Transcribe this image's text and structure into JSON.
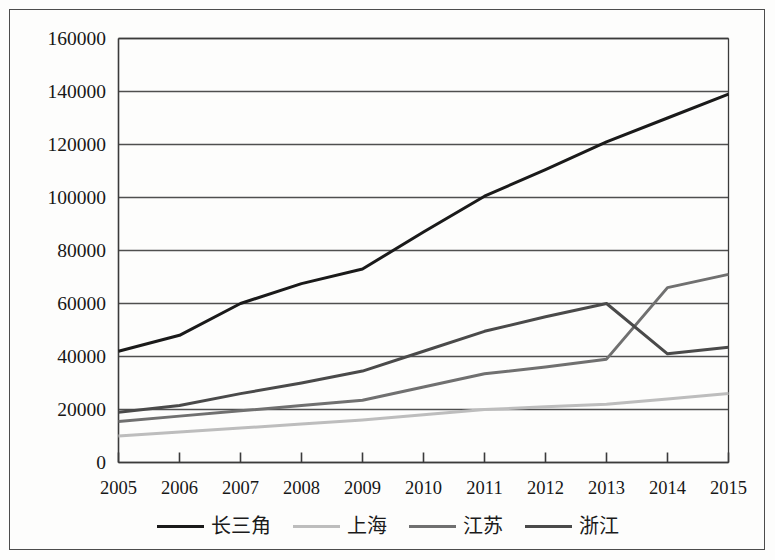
{
  "chart_data": {
    "type": "line",
    "title": "",
    "subtitle": "",
    "xlabel": "",
    "ylabel": "",
    "x": [
      2005,
      2006,
      2007,
      2008,
      2009,
      2010,
      2011,
      2012,
      2013,
      2014,
      2015
    ],
    "categories": [
      "2005",
      "2006",
      "2007",
      "2008",
      "2009",
      "2010",
      "2011",
      "2012",
      "2013",
      "2014",
      "2015"
    ],
    "xlim": [
      2005,
      2015
    ],
    "ylim": [
      0,
      160000
    ],
    "ytick_values": [
      0,
      20000,
      40000,
      60000,
      80000,
      100000,
      120000,
      140000,
      160000
    ],
    "ytick_labels": [
      "0",
      "20000",
      "40000",
      "60000",
      "80000",
      "100000",
      "120000",
      "140000",
      "160000"
    ],
    "grid": true,
    "grid_axis": "y",
    "legend_position": "bottom",
    "series": [
      {
        "name": "长三角",
        "color": "#1a1a1a",
        "width": 3.0,
        "values": [
          42000,
          48000,
          60000,
          67500,
          73000,
          87000,
          100500,
          110500,
          121000,
          130000,
          139000
        ]
      },
      {
        "name": "上海",
        "color": "#bdbdbd",
        "width": 3.0,
        "values": [
          10000,
          11500,
          13000,
          14500,
          16000,
          18000,
          20000,
          21000,
          22000,
          24000,
          26000
        ]
      },
      {
        "name": "江苏",
        "color": "#707070",
        "width": 3.0,
        "values": [
          15500,
          17500,
          19500,
          21500,
          23500,
          28500,
          33500,
          36000,
          39000,
          66000,
          71000
        ]
      },
      {
        "name": "浙江",
        "color": "#4a4a4a",
        "width": 3.0,
        "values": [
          19000,
          21500,
          26000,
          30000,
          34500,
          42000,
          49500,
          55000,
          60000,
          41000,
          43500
        ]
      }
    ]
  },
  "legend": {
    "items": [
      {
        "label": "长三角",
        "color": "#1a1a1a"
      },
      {
        "label": "上海",
        "color": "#bdbdbd"
      },
      {
        "label": "江苏",
        "color": "#707070"
      },
      {
        "label": "浙江",
        "color": "#4a4a4a"
      }
    ]
  },
  "axis": {
    "y_labels": [
      "160000",
      "140000",
      "120000",
      "100000",
      "80000",
      "60000",
      "40000",
      "20000",
      "0"
    ],
    "x_labels": [
      "2005",
      "2006",
      "2007",
      "2008",
      "2009",
      "2010",
      "2011",
      "2012",
      "2013",
      "2014",
      "2015"
    ]
  },
  "colors": {
    "frame": "#4c4c4c",
    "axis": "#3b3b3b",
    "gridline": "#4f4f4f",
    "background": "#fdfdfc"
  }
}
